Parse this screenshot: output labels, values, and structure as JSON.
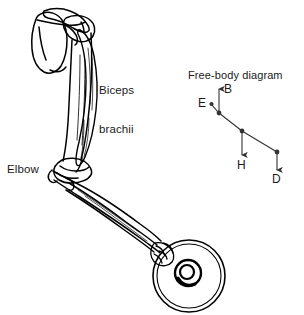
{
  "figure": {
    "type": "anatomical-diagram",
    "background": "#ffffff",
    "ink": "#000000"
  },
  "anatomy": {
    "name": "arm-skeleton-drawing",
    "labels": {
      "biceps_line1": "Biceps",
      "biceps_line2": "brachii",
      "elbow": "Elbow"
    },
    "parts": [
      "scapula",
      "humerus",
      "biceps-brachii-muscle",
      "elbow-joint",
      "radius",
      "ulna",
      "hand",
      "weight-plate"
    ]
  },
  "fbd": {
    "title": "Free-body diagram",
    "vectors": [
      {
        "label": "B",
        "direction": "up",
        "origin_x": 219,
        "origin_y": 113,
        "tip_x": 219,
        "tip_y": 88
      },
      {
        "label": "H",
        "direction": "down",
        "origin_x": 242,
        "origin_y": 131,
        "tip_x": 242,
        "tip_y": 157
      },
      {
        "label": "D",
        "direction": "down",
        "origin_x": 277,
        "origin_y": 152,
        "tip_x": 277,
        "tip_y": 172
      }
    ],
    "points": [
      {
        "label": "E",
        "x": 212,
        "y": 104
      },
      {
        "label": "",
        "x": 219,
        "y": 113
      },
      {
        "label": "",
        "x": 242,
        "y": 131
      },
      {
        "label": "",
        "x": 277,
        "y": 152
      }
    ],
    "segment_label": "forearm-segment",
    "point_labels": {
      "E": "E",
      "B": "B",
      "H": "H",
      "D": "D"
    }
  }
}
